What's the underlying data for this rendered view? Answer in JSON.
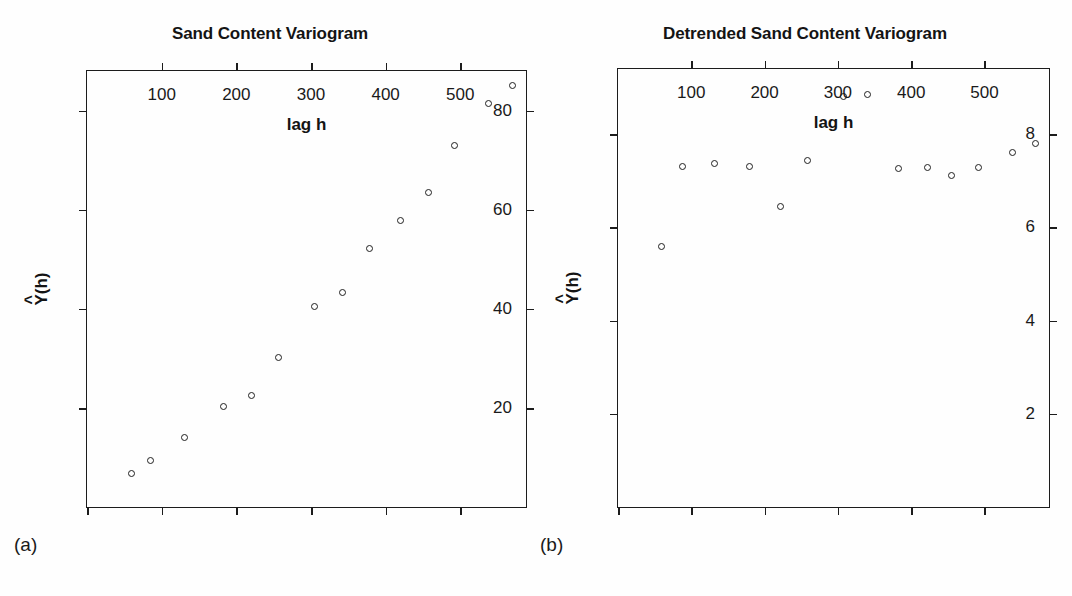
{
  "figure": {
    "background": "#fefefe",
    "ink_color": "#1a1a1a"
  },
  "panels": [
    {
      "tag": "(a)",
      "title": "Sand Content Variogram",
      "xlabel": "lag h",
      "ylabel_base": "Y",
      "ylabel_hat": "^",
      "ylabel_arg": "(h)"
    },
    {
      "tag": "(b)",
      "title": "Detrended Sand Content Variogram",
      "xlabel": "lag h",
      "ylabel_base": "Y",
      "ylabel_hat": "^",
      "ylabel_arg": "(h)"
    }
  ],
  "chart_data": [
    {
      "type": "scatter",
      "title": "Sand Content Variogram",
      "panel_tag": "(a)",
      "xlabel": "lag h",
      "ylabel": "Y^(h)",
      "xlim": [
        0,
        588
      ],
      "ylim": [
        0,
        88
      ],
      "xticks": [
        100,
        200,
        300,
        400,
        500
      ],
      "yticks": [
        20,
        40,
        60,
        80
      ],
      "xtick_labels": [
        "100",
        "200",
        "300",
        "400",
        "500"
      ],
      "ytick_labels": [
        "20",
        "40",
        "60",
        "80"
      ],
      "grid": false,
      "legend": null,
      "marker": "open-circle",
      "x": [
        60,
        85,
        130,
        183,
        220,
        257,
        305,
        342,
        378,
        420,
        457,
        492,
        538,
        570
      ],
      "y": [
        6.8,
        9.3,
        14.0,
        20.2,
        22.6,
        30.2,
        40.5,
        43.2,
        52.2,
        57.8,
        63.4,
        73.0,
        81.5,
        85.0
      ]
    },
    {
      "type": "scatter",
      "title": "Detrended Sand Content Variogram",
      "panel_tag": "(b)",
      "xlabel": "lag h",
      "ylabel": "Y^(h)",
      "xlim": [
        0,
        588
      ],
      "ylim": [
        0,
        9.4
      ],
      "xticks": [
        100,
        200,
        300,
        400,
        500
      ],
      "yticks": [
        2,
        4,
        6,
        8
      ],
      "xtick_labels": [
        "100",
        "200",
        "300",
        "400",
        "500"
      ],
      "ytick_labels": [
        "2",
        "4",
        "6",
        "8"
      ],
      "grid": false,
      "legend": null,
      "marker": "open-circle",
      "x": [
        60,
        88,
        131,
        180,
        222,
        258,
        307,
        340,
        382,
        422,
        455,
        492,
        538,
        570
      ],
      "y": [
        5.6,
        7.3,
        7.37,
        7.3,
        6.45,
        7.43,
        8.8,
        8.85,
        7.27,
        7.28,
        7.12,
        7.28,
        7.6,
        7.8
      ]
    }
  ]
}
